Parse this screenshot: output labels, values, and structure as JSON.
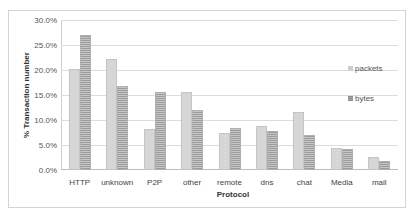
{
  "chart_data": {
    "type": "bar",
    "title": "",
    "xlabel": "Protocol",
    "ylabel": "% Transaction number",
    "ylim": [
      0,
      30
    ],
    "yticks": [
      "0.0%",
      "5.0%",
      "10.0%",
      "15.0%",
      "20.0%",
      "25.0%",
      "30.0%"
    ],
    "grid": true,
    "legend_position": "right",
    "categories": [
      "HTTP",
      "unknown",
      "P2P",
      "other",
      "remote",
      "dns",
      "chat",
      "Media",
      "mail"
    ],
    "series": [
      {
        "name": "packets",
        "values": [
          20.2,
          22.2,
          8.2,
          15.6,
          7.4,
          8.8,
          11.6,
          4.4,
          2.6
        ]
      },
      {
        "name": "bytes",
        "values": [
          27.0,
          16.8,
          15.6,
          12.0,
          8.4,
          7.8,
          7.0,
          4.2,
          1.8
        ]
      }
    ]
  },
  "legend": {
    "packets": "packets",
    "bytes": "bytes"
  },
  "axis": {
    "x_title": "Protocol",
    "y_title": "% Transaction number"
  }
}
